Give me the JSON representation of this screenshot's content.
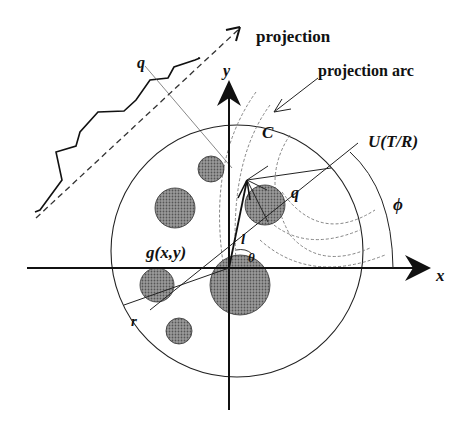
{
  "diagram": {
    "labels": {
      "projection": "projection",
      "projection_arc": "projection arc",
      "q_top": "q",
      "q_mid": "q",
      "y_axis": "y",
      "x_axis": "x",
      "C": "C",
      "U": "U(T/R)",
      "phi": "ϕ",
      "l": "l",
      "theta": "θ",
      "g": "g(x,y)",
      "r": "r"
    },
    "colors": {
      "ink": "#111111",
      "blob": "#8a8a8a",
      "arc": "#777777"
    }
  }
}
